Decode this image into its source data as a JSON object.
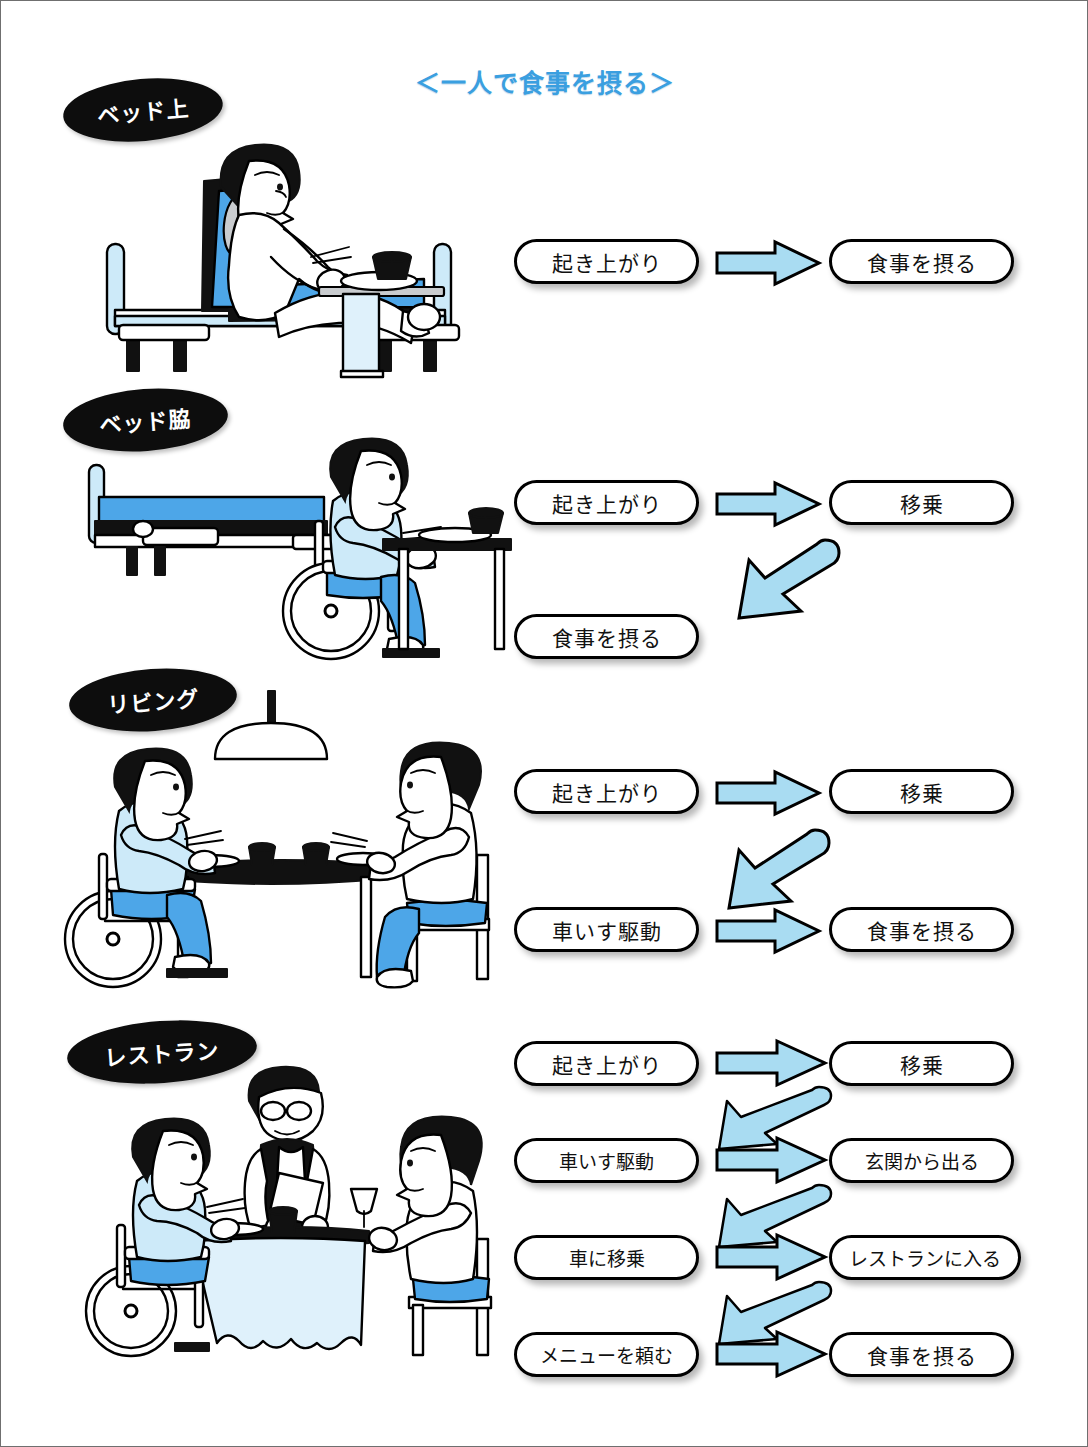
{
  "title": "＜一人で食事を摂る＞",
  "colors": {
    "title_blue": "#3a9fe0",
    "arrow_fill": "#a9dcf2",
    "label_black": "#0d0d0d",
    "illustration_blue_dark": "#4da6e8",
    "illustration_blue_light": "#cdeaf9",
    "pill_border": "#000000",
    "page_background": "#ffffff"
  },
  "scenes": [
    {
      "label": "ベッド上",
      "illustration": "person-sitting-up-in-bed-eating-at-overbed-table",
      "steps": [
        "起き上がり",
        "食事を摂る"
      ],
      "flow": [
        {
          "from": "起き上がり",
          "to": "食事を摂る",
          "arrow": "right"
        }
      ]
    },
    {
      "label": "ベッド脇",
      "illustration": "person-in-wheelchair-beside-bed-eating-at-table",
      "steps": [
        "起き上がり",
        "移乗",
        "食事を摂る"
      ],
      "flow": [
        {
          "from": "起き上がり",
          "to": "移乗",
          "arrow": "right"
        },
        {
          "from": "移乗",
          "to": "食事を摂る",
          "arrow": "down-left"
        }
      ]
    },
    {
      "label": "リビング",
      "illustration": "two-people-dining-at-living-room-table-under-pendant-lamp",
      "steps": [
        "起き上がり",
        "移乗",
        "車いす駆動",
        "食事を摂る"
      ],
      "flow": [
        {
          "from": "起き上がり",
          "to": "移乗",
          "arrow": "right"
        },
        {
          "from": "移乗",
          "to": "車いす駆動",
          "arrow": "down-left"
        },
        {
          "from": "車いす駆動",
          "to": "食事を摂る",
          "arrow": "right"
        }
      ]
    },
    {
      "label": "レストラン",
      "illustration": "restaurant-table-with-wheelchair-user-waiter-and-woman",
      "steps": [
        "起き上がり",
        "移乗",
        "車いす駆動",
        "玄関から出る",
        "車に移乗",
        "レストランに入る",
        "メニューを頼む",
        "食事を摂る"
      ],
      "flow": [
        {
          "from": "起き上がり",
          "to": "移乗",
          "arrow": "right"
        },
        {
          "from": "移乗",
          "to": "車いす駆動",
          "arrow": "down-left-thin"
        },
        {
          "from": "車いす駆動",
          "to": "玄関から出る",
          "arrow": "right"
        },
        {
          "from": "玄関から出る",
          "to": "車に移乗",
          "arrow": "down-left-thin"
        },
        {
          "from": "車に移乗",
          "to": "レストランに入る",
          "arrow": "right"
        },
        {
          "from": "レストランに入る",
          "to": "メニューを頼む",
          "arrow": "down-left-thin"
        },
        {
          "from": "メニューを頼む",
          "to": "食事を摂る",
          "arrow": "right"
        }
      ]
    }
  ],
  "icons": {
    "scene_label": "oval-badge",
    "arrow_right": "block-arrow-right-icon",
    "arrow_down_left": "block-arrow-down-left-icon"
  }
}
